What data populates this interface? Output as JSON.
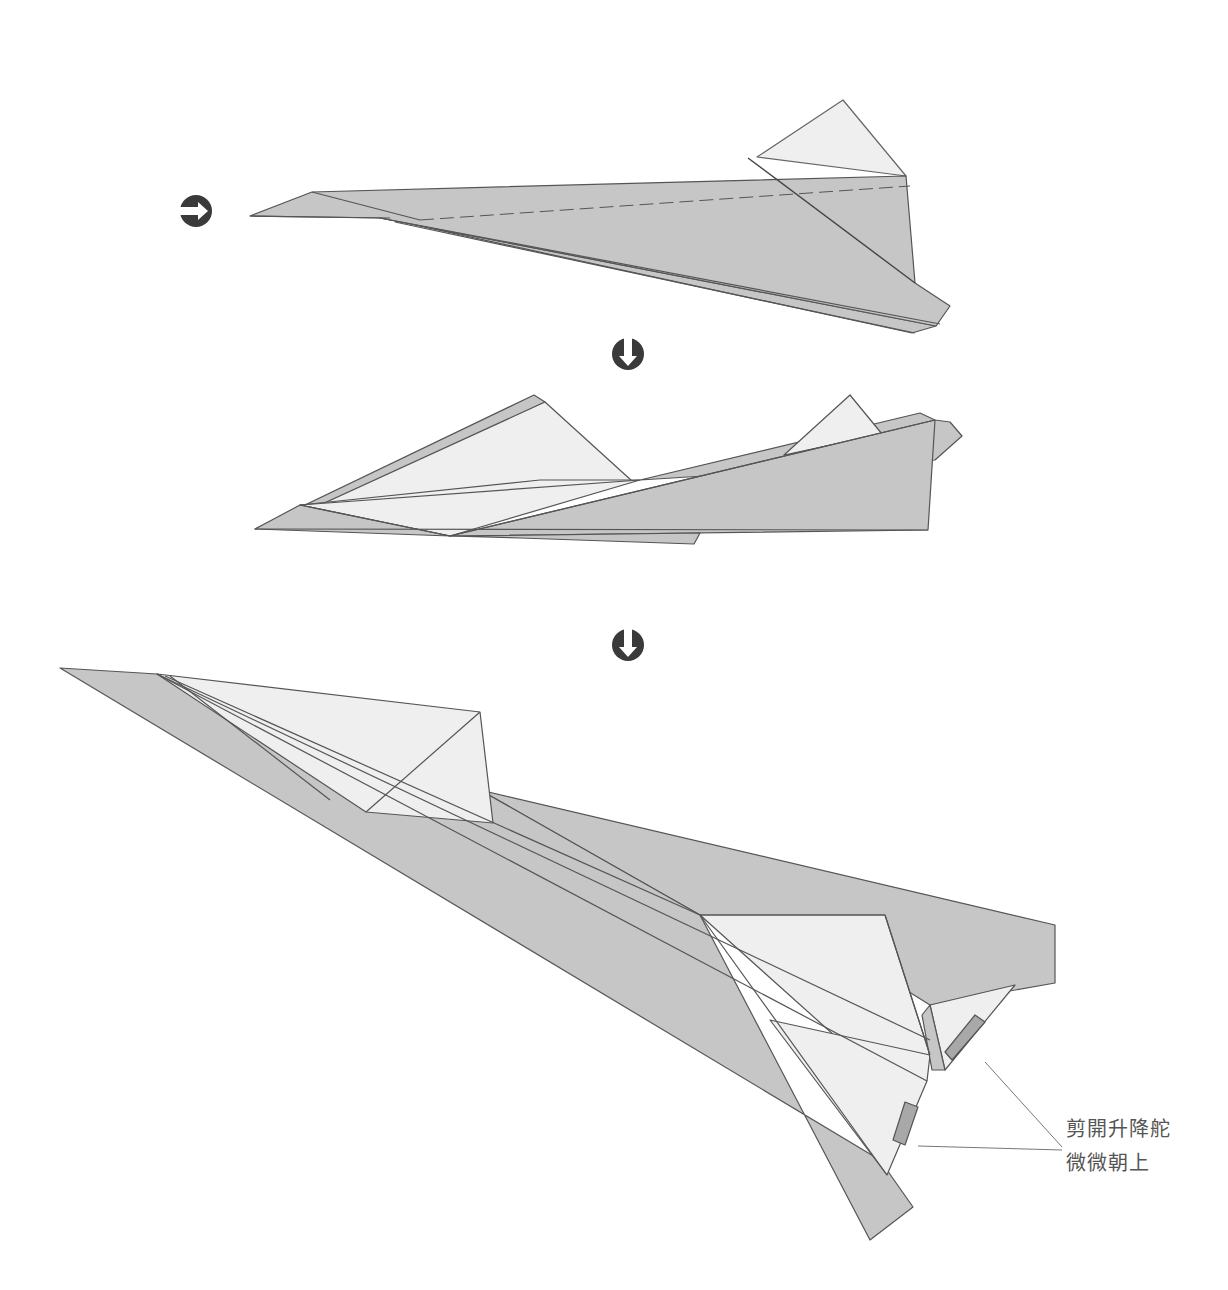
{
  "diagram": {
    "title": "",
    "type": "paper-airplane folding instructions",
    "colors": {
      "background": "#ffffff",
      "paper_front": "#c6c6c6",
      "paper_back": "#efefef",
      "fold_line": "#555555",
      "arrow_icon": "#3a3a3a",
      "elevator_cut": "#a8a8a8",
      "label_text": "#555555"
    },
    "steps": [
      {
        "id": "step-1",
        "description": "Side view of folded airplane body",
        "arrow_before": "arrow-right"
      },
      {
        "id": "step-2",
        "description": "Open wings",
        "arrow_before": "arrow-down"
      },
      {
        "id": "step-3",
        "description": "Finished airplane with elevators",
        "arrow_before": "arrow-down"
      }
    ],
    "arrows": [
      {
        "name": "step-arrow-right",
        "direction": "right"
      },
      {
        "name": "step-arrow-down-1",
        "direction": "down"
      },
      {
        "name": "step-arrow-down-2",
        "direction": "down"
      }
    ],
    "annotation": {
      "line1": "剪開升降舵",
      "line2": "微微朝上"
    }
  }
}
